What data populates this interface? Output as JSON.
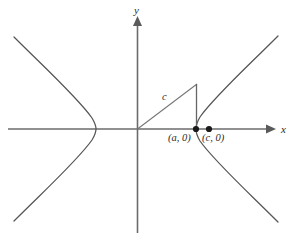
{
  "figure": {
    "kind": "hyperbola-diagram",
    "width": 298,
    "height": 242,
    "background_color": "#ffffff",
    "curve_color": "#555555",
    "axis_color": "#6b6b6b",
    "point_color": "#1a1a1a",
    "axes": {
      "x_label": "x",
      "y_label": "y",
      "origin": {
        "x": 137,
        "y": 129
      },
      "x_axis_start": {
        "x": 8,
        "y": 129
      },
      "x_axis_end": {
        "x": 274,
        "y": 129
      },
      "y_axis_top": {
        "x": 137,
        "y": 17
      },
      "y_axis_bottom": {
        "x": 137,
        "y": 233
      },
      "x_arrow": true,
      "y_arrow": true
    },
    "labels": {
      "vertex_point": "(a, 0)",
      "focus_point": "(c, 0)",
      "hypotenuse": "c"
    },
    "points": [
      {
        "name": "vertex",
        "label": "(a, 0)",
        "x": 196,
        "y": 129,
        "radius": 3.1
      },
      {
        "name": "focus",
        "label": "(c, 0)",
        "x": 209,
        "y": 129,
        "radius": 3.1
      }
    ],
    "triangle": {
      "origin": {
        "x": 137,
        "y": 129
      },
      "apex": {
        "x": 197,
        "y": 84
      },
      "foot": {
        "x": 196,
        "y": 129
      },
      "hypotenuse_label": "c"
    },
    "hyperbola": {
      "left_vertex": {
        "x": 96,
        "y": 129
      },
      "right_vertex": {
        "x": 196,
        "y": 129
      },
      "left_branch_upper_end": {
        "x": 14,
        "y": 37
      },
      "left_branch_lower_end": {
        "x": 14,
        "y": 221
      },
      "right_branch_upper_end": {
        "x": 278,
        "y": 36
      },
      "right_branch_lower_end": {
        "x": 278,
        "y": 222
      }
    }
  }
}
